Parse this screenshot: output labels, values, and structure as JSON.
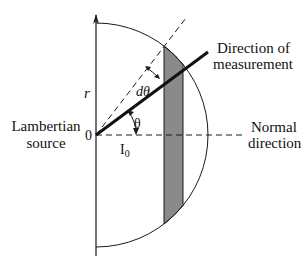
{
  "diagram": {
    "labels": {
      "radius": "r",
      "d_theta": "dθ",
      "theta": "θ",
      "origin": "0",
      "intensity": "I",
      "intensity_sub": "0",
      "source_line1": "Lambertian",
      "source_line2": "source",
      "measurement_line1": "Direction of",
      "measurement_line2": "measurement",
      "normal_line1": "Normal",
      "normal_line2": "direction"
    },
    "colors": {
      "stroke": "#1a1a1a",
      "shaded_strip": "#8a8a8a",
      "background": "#ffffff"
    }
  }
}
